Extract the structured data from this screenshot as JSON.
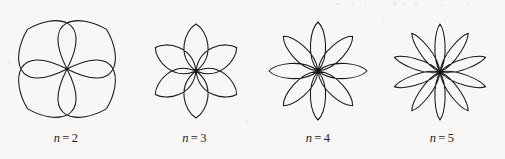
{
  "figure": {
    "background_color": "#f8f7f5",
    "stroke_color": "#17161a",
    "caption_color": "#24222a",
    "width": 505,
    "height": 159
  },
  "chart_data": {
    "type": "line",
    "title": "",
    "subtitle": "",
    "xlabel": "",
    "ylabel": "",
    "coordinate_system": "polar",
    "equation": "r = cos(n theta)",
    "grid": false,
    "axes_visible": false,
    "legend": false,
    "panels": [
      {
        "index": 0,
        "label_variable": "n",
        "label_operator": "=",
        "label_value": "2",
        "label_text": "n = 2",
        "n": 2,
        "petal_count": 4,
        "center_x": 67,
        "center_y": 69,
        "radius": 56,
        "rotation_deg": 45,
        "petal_width_ratio": 0.78
      },
      {
        "index": 1,
        "label_variable": "n",
        "label_operator": "=",
        "label_value": "3",
        "label_text": "n = 3",
        "n": 3,
        "petal_count": 6,
        "center_x": 196,
        "center_y": 71,
        "radius": 47,
        "rotation_deg": 90,
        "petal_width_ratio": 0.56
      },
      {
        "index": 2,
        "label_variable": "n",
        "label_operator": "=",
        "label_value": "4",
        "label_text": "n = 4",
        "n": 4,
        "petal_count": 8,
        "center_x": 318,
        "center_y": 71,
        "radius": 49,
        "rotation_deg": 0,
        "petal_width_ratio": 0.46
      },
      {
        "index": 3,
        "label_variable": "n",
        "label_operator": "=",
        "label_value": "5",
        "label_text": "n = 5",
        "n": 5,
        "petal_count": 10,
        "center_x": 440,
        "center_y": 72,
        "radius": 48,
        "rotation_deg": 90,
        "petal_width_ratio": 0.4
      }
    ]
  }
}
